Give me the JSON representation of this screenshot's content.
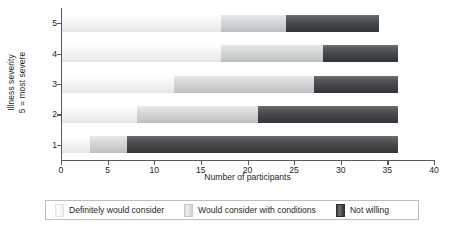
{
  "chart_data": {
    "type": "bar",
    "orientation": "horizontal",
    "stacked": true,
    "title": "",
    "xlabel": "Number of participants",
    "ylabel_lines": [
      "Illness severity",
      "5 = most severe"
    ],
    "categories": [
      "1",
      "2",
      "3",
      "4",
      "5"
    ],
    "category_order_top_to_bottom": [
      "5",
      "4",
      "3",
      "2",
      "1"
    ],
    "xlim": [
      0,
      40
    ],
    "xticks": [
      0,
      5,
      10,
      15,
      20,
      25,
      30,
      35,
      40
    ],
    "xtick_labels": [
      "0",
      "5",
      "10",
      "15",
      "20",
      "25",
      "30",
      "35",
      "40"
    ],
    "grid": false,
    "legend_position": "bottom",
    "series": [
      {
        "name": "Definitely would consider",
        "color": "#f2f2f2",
        "values": [
          3,
          8,
          12,
          17,
          17
        ]
      },
      {
        "name": "Would consider with conditions",
        "color": "#d2d3d4",
        "values": [
          4,
          13,
          15,
          11,
          7
        ]
      },
      {
        "name": "Not willing",
        "color": "#46474a",
        "values": [
          29,
          15,
          9,
          8,
          10
        ]
      }
    ],
    "totals": [
      36,
      36,
      36,
      36,
      34
    ],
    "annotations": []
  },
  "legend": {
    "items": [
      {
        "label": "Definitely would consider",
        "swatch": "light-swatch"
      },
      {
        "label": "Would consider with conditions",
        "swatch": "medium-swatch"
      },
      {
        "label": "Not willing",
        "swatch": "dark-swatch"
      }
    ]
  }
}
